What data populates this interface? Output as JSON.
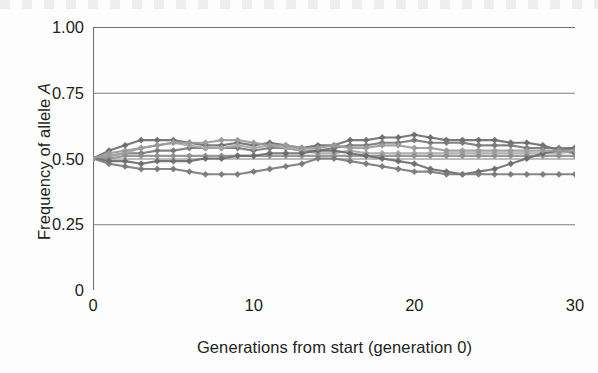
{
  "figure": {
    "background": "#fdfdfd",
    "axis_color": "#6f6f6f",
    "text_color": "#231f20"
  },
  "axes": {
    "y_title_prefix": "Frequency of allele ",
    "y_title_italic": "A",
    "x_title": "Generations from start (generation 0)"
  },
  "chart_data": {
    "type": "line",
    "title": "",
    "xlabel": "Generations from start (generation 0)",
    "ylabel": "Frequency of allele A",
    "xlim": [
      0,
      30
    ],
    "ylim": [
      0,
      1.0
    ],
    "xticks": [
      0,
      10,
      20,
      30
    ],
    "xtick_labels": [
      "0",
      "10",
      "20",
      "30"
    ],
    "x_minor_tick_interval": 1,
    "yticks": [
      0,
      0.25,
      0.5,
      0.75,
      1.0
    ],
    "ytick_labels": [
      "0",
      "0.25",
      "0.50",
      "0.75",
      "1.00"
    ],
    "grid": "horizontal",
    "legend": "none",
    "marker": "diamond",
    "x": [
      0,
      1,
      2,
      3,
      4,
      5,
      6,
      7,
      8,
      9,
      10,
      11,
      12,
      13,
      14,
      15,
      16,
      17,
      18,
      19,
      20,
      21,
      22,
      23,
      24,
      25,
      26,
      27,
      28,
      29,
      30
    ],
    "series": [
      {
        "name": "population-1",
        "color": "#6b6b6b",
        "values": [
          0.5,
          0.53,
          0.55,
          0.57,
          0.57,
          0.57,
          0.56,
          0.55,
          0.55,
          0.56,
          0.55,
          0.56,
          0.55,
          0.54,
          0.55,
          0.55,
          0.57,
          0.57,
          0.58,
          0.58,
          0.59,
          0.58,
          0.57,
          0.57,
          0.57,
          0.57,
          0.56,
          0.56,
          0.55,
          0.53,
          0.52
        ]
      },
      {
        "name": "population-2",
        "color": "#777777",
        "values": [
          0.5,
          0.51,
          0.52,
          0.52,
          0.53,
          0.53,
          0.54,
          0.54,
          0.54,
          0.54,
          0.53,
          0.54,
          0.54,
          0.53,
          0.53,
          0.54,
          0.55,
          0.55,
          0.56,
          0.56,
          0.57,
          0.56,
          0.56,
          0.56,
          0.55,
          0.55,
          0.55,
          0.54,
          0.54,
          0.54,
          0.54
        ]
      },
      {
        "name": "population-3",
        "color": "#a6a6a6",
        "values": [
          0.5,
          0.51,
          0.52,
          0.54,
          0.55,
          0.56,
          0.55,
          0.54,
          0.54,
          0.55,
          0.54,
          0.55,
          0.54,
          0.53,
          0.52,
          0.52,
          0.53,
          0.52,
          0.52,
          0.52,
          0.52,
          0.52,
          0.52,
          0.52,
          0.52,
          0.52,
          0.52,
          0.52,
          0.52,
          0.52,
          0.53
        ]
      },
      {
        "name": "population-4",
        "color": "#8f8f8f",
        "values": [
          0.5,
          0.5,
          0.51,
          0.51,
          0.51,
          0.51,
          0.51,
          0.51,
          0.51,
          0.51,
          0.51,
          0.51,
          0.51,
          0.51,
          0.51,
          0.51,
          0.51,
          0.51,
          0.51,
          0.51,
          0.51,
          0.51,
          0.51,
          0.51,
          0.51,
          0.51,
          0.51,
          0.51,
          0.51,
          0.51,
          0.51
        ]
      },
      {
        "name": "population-5",
        "color": "#6b6b6b",
        "values": [
          0.5,
          0.49,
          0.49,
          0.48,
          0.49,
          0.49,
          0.49,
          0.5,
          0.5,
          0.51,
          0.51,
          0.52,
          0.52,
          0.52,
          0.53,
          0.53,
          0.52,
          0.51,
          0.5,
          0.49,
          0.48,
          0.46,
          0.45,
          0.44,
          0.45,
          0.46,
          0.48,
          0.5,
          0.52,
          0.53,
          0.54
        ]
      },
      {
        "name": "population-6",
        "color": "#7a7a7a",
        "values": [
          0.5,
          0.48,
          0.47,
          0.46,
          0.46,
          0.46,
          0.45,
          0.44,
          0.44,
          0.44,
          0.45,
          0.46,
          0.47,
          0.48,
          0.5,
          0.5,
          0.49,
          0.48,
          0.47,
          0.46,
          0.45,
          0.45,
          0.44,
          0.44,
          0.44,
          0.44,
          0.44,
          0.44,
          0.44,
          0.44,
          0.44
        ]
      },
      {
        "name": "population-7",
        "color": "#9a9a9a",
        "values": [
          0.5,
          0.52,
          0.53,
          0.54,
          0.55,
          0.56,
          0.56,
          0.56,
          0.57,
          0.57,
          0.56,
          0.55,
          0.55,
          0.54,
          0.54,
          0.55,
          0.54,
          0.54,
          0.55,
          0.55,
          0.54,
          0.54,
          0.53,
          0.53,
          0.53,
          0.53,
          0.53,
          0.53,
          0.53,
          0.53,
          0.53
        ]
      }
    ]
  }
}
